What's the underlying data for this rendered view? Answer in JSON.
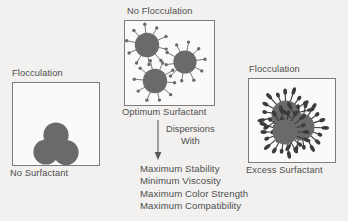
{
  "figure": {
    "background_color": "#f2f1ef",
    "ink_color": "#4e4e4e",
    "particle_color": "#6a6a6a",
    "box_border_color": "#7d7c7a"
  },
  "panels": [
    {
      "id": "no-surfactant",
      "top_caption": "Flocculation",
      "bottom_caption": "No Surfactant",
      "state": "flocculated",
      "particle_count": 3,
      "surfactant_spikes_per_particle": 0,
      "description": "Three bare pigment particles clumped together in a triangular cluster"
    },
    {
      "id": "optimum-surfactant",
      "top_caption": "No Flocculation",
      "bottom_caption": "Optimum Surfactant",
      "state": "dispersed",
      "particle_count": 3,
      "surfactant_spikes_per_particle": 10,
      "description": "Three separated particles, each evenly coated with radiating surfactant molecules"
    },
    {
      "id": "excess-surfactant",
      "top_caption": "Flocculation",
      "bottom_caption": "Excess Surfactant",
      "state": "flocculated",
      "particle_count": 3,
      "surfactant_spikes_per_particle": 18,
      "description": "Three overlapping particles with dense excess surfactant spikes, re-flocculated"
    }
  ],
  "arrow": {
    "label_line_1": "Dispersions",
    "label_line_2": "With",
    "direction": "down",
    "from_panel": "optimum-surfactant"
  },
  "benefits": [
    "Maximum Stability",
    "Minimum Viscosity",
    "Maximum Color Strength",
    "Maximum Compatibility"
  ]
}
